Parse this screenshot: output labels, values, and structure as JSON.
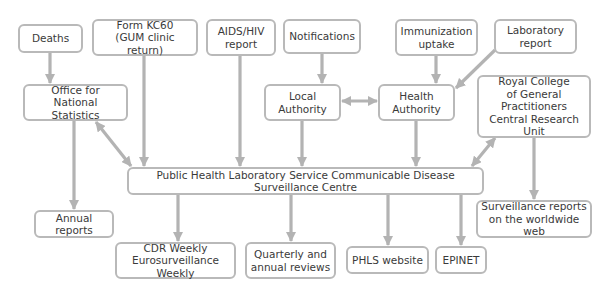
{
  "colors": {
    "line": "#b3b3b3",
    "border": "#b9b9b9",
    "text": "#3a3a3a",
    "background": "#ffffff"
  },
  "nodes": {
    "deaths": {
      "label": "Deaths",
      "x": 18,
      "y": 24,
      "w": 65,
      "h": 29
    },
    "form_kc60": {
      "label": "Form KC60\n(GUM clinic return)",
      "x": 92,
      "y": 19,
      "w": 106,
      "h": 37
    },
    "aids_hiv": {
      "label": "AIDS/HIV\nreport",
      "x": 206,
      "y": 19,
      "w": 70,
      "h": 37
    },
    "notifications": {
      "label": "Notifications",
      "x": 283,
      "y": 19,
      "w": 78,
      "h": 35
    },
    "immunization": {
      "label": "Immunization\nuptake",
      "x": 395,
      "y": 19,
      "w": 83,
      "h": 37
    },
    "laboratory": {
      "label": "Laboratory\nreport",
      "x": 494,
      "y": 19,
      "w": 83,
      "h": 35
    },
    "ons": {
      "label": "Office for\nNational Statistics",
      "x": 23,
      "y": 84,
      "w": 105,
      "h": 37
    },
    "local_authority": {
      "label": "Local\nAuthority",
      "x": 264,
      "y": 84,
      "w": 77,
      "h": 37
    },
    "health_authority": {
      "label": "Health\nAuthority",
      "x": 378,
      "y": 84,
      "w": 77,
      "h": 37
    },
    "rcgp": {
      "label": "Royal College\nof General\nPractitioners\nCentral Research Unit",
      "x": 477,
      "y": 75,
      "w": 114,
      "h": 63
    },
    "phls_cdsc": {
      "label": "Public Health Laboratory Service Communicable Disease Surveillance Centre",
      "x": 127,
      "y": 167,
      "w": 357,
      "h": 28
    },
    "annual_reports": {
      "label": "Annual reports",
      "x": 34,
      "y": 210,
      "w": 80,
      "h": 28
    },
    "cdr_weekly": {
      "label": "CDR Weekly\nEurosurveillance Weekly",
      "x": 115,
      "y": 242,
      "w": 121,
      "h": 37
    },
    "quarterly": {
      "label": "Quarterly and\nannual reviews",
      "x": 245,
      "y": 242,
      "w": 91,
      "h": 37
    },
    "phls_website": {
      "label": "PHLS website",
      "x": 346,
      "y": 246,
      "w": 83,
      "h": 28
    },
    "epinet": {
      "label": "EPINET",
      "x": 435,
      "y": 246,
      "w": 52,
      "h": 28
    },
    "surveillance_web": {
      "label": "Surveillance reports\non the worldwide web",
      "x": 476,
      "y": 200,
      "w": 116,
      "h": 38
    }
  },
  "edges": [
    {
      "from": "deaths",
      "to": "ons",
      "x1": 50,
      "y1": 53,
      "x2": 50,
      "y2": 83,
      "bidirectional": false
    },
    {
      "from": "form_kc60",
      "to": "phls_cdsc",
      "x1": 144,
      "y1": 56,
      "x2": 144,
      "y2": 166,
      "bidirectional": false
    },
    {
      "from": "aids_hiv",
      "to": "phls_cdsc",
      "x1": 240,
      "y1": 56,
      "x2": 240,
      "y2": 166,
      "bidirectional": false
    },
    {
      "from": "notifications",
      "to": "local_authority",
      "x1": 322,
      "y1": 54,
      "x2": 322,
      "y2": 83,
      "bidirectional": false
    },
    {
      "from": "immunization",
      "to": "health_authority",
      "x1": 436,
      "y1": 56,
      "x2": 436,
      "y2": 83,
      "bidirectional": false
    },
    {
      "from": "laboratory",
      "to": "health_authority",
      "x1": 495,
      "y1": 50,
      "x2": 456,
      "y2": 88,
      "bidirectional": false
    },
    {
      "from": "local_authority",
      "to": "health_authority",
      "x1": 342,
      "y1": 101,
      "x2": 377,
      "y2": 101,
      "bidirectional": true
    },
    {
      "from": "ons",
      "to": "phls_cdsc",
      "x1": 96,
      "y1": 122,
      "x2": 131,
      "y2": 166,
      "bidirectional": true
    },
    {
      "from": "local_authority",
      "to": "phls_cdsc",
      "x1": 302,
      "y1": 121,
      "x2": 302,
      "y2": 166,
      "bidirectional": false
    },
    {
      "from": "health_authority",
      "to": "phls_cdsc",
      "x1": 416,
      "y1": 121,
      "x2": 416,
      "y2": 166,
      "bidirectional": false
    },
    {
      "from": "rcgp",
      "to": "phls_cdsc",
      "x1": 495,
      "y1": 138,
      "x2": 472,
      "y2": 166,
      "bidirectional": true
    },
    {
      "from": "ons",
      "to": "annual_reports",
      "x1": 74,
      "y1": 121,
      "x2": 74,
      "y2": 209,
      "bidirectional": false
    },
    {
      "from": "rcgp",
      "to": "surveillance_web",
      "x1": 534,
      "y1": 138,
      "x2": 534,
      "y2": 199,
      "bidirectional": false
    },
    {
      "from": "phls_cdsc",
      "to": "cdr_weekly",
      "x1": 178,
      "y1": 195,
      "x2": 178,
      "y2": 241,
      "bidirectional": false
    },
    {
      "from": "phls_cdsc",
      "to": "quarterly",
      "x1": 291,
      "y1": 195,
      "x2": 291,
      "y2": 241,
      "bidirectional": false
    },
    {
      "from": "phls_cdsc",
      "to": "phls_website",
      "x1": 388,
      "y1": 195,
      "x2": 388,
      "y2": 245,
      "bidirectional": false
    },
    {
      "from": "phls_cdsc",
      "to": "epinet",
      "x1": 461,
      "y1": 195,
      "x2": 461,
      "y2": 245,
      "bidirectional": false
    }
  ]
}
